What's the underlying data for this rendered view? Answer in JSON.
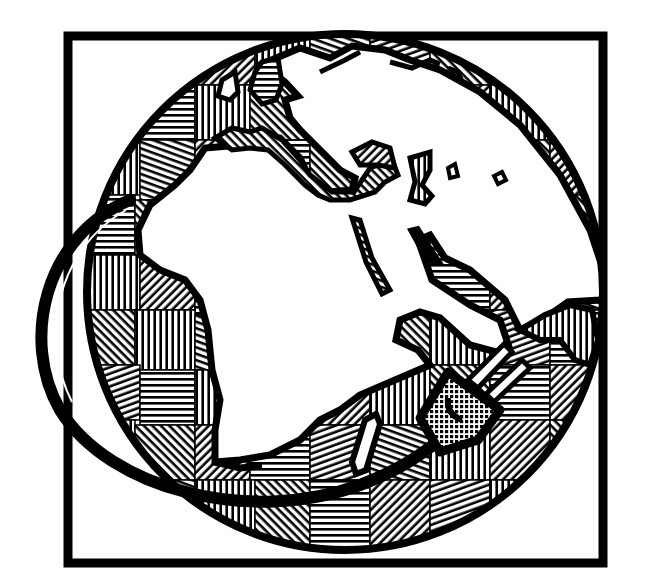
{
  "illustration": {
    "subject": "Globe showing Europe, Africa and Arabia with an electrical cord wrapping around it ending in a plug, inside a square frame",
    "style": "black-and-white line-art clip art, land masses filled with woven hatch patches",
    "colors": {
      "ink": "#000000",
      "paper": "#ffffff"
    },
    "elements": {
      "frame": "square-frame",
      "globe": "globe",
      "continents": [
        "Europe",
        "Africa",
        "Arabian Peninsula",
        "Madagascar",
        "British Isles"
      ],
      "cord": "power-cord",
      "plug": "power-plug"
    }
  }
}
